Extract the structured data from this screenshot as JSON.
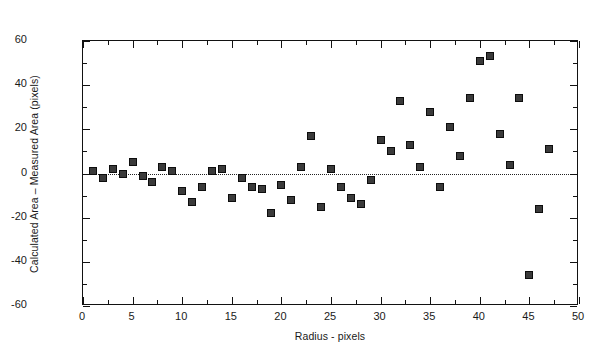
{
  "chart_data": {
    "type": "scatter",
    "title": "",
    "xlabel": "Radius - pixels",
    "ylabel": "Calculated Area – Measured Area (pixels)",
    "xlim": [
      0,
      50
    ],
    "ylim": [
      -60,
      60
    ],
    "xticks": [
      0,
      5,
      10,
      15,
      20,
      25,
      30,
      35,
      40,
      45,
      50
    ],
    "yticks": [
      -60,
      -40,
      -20,
      0,
      20,
      40,
      60
    ],
    "xtick_labels": [
      "0",
      "5",
      "10",
      "15",
      "20",
      "25",
      "30",
      "35",
      "40",
      "45",
      "50"
    ],
    "ytick_labels": [
      "-60",
      "-40",
      "-20",
      "0",
      "20",
      "40",
      "60"
    ],
    "x_minor_interval": 2.5,
    "y_minor_interval": 10,
    "grid": false,
    "legend": false,
    "reference_line": {
      "type": "horizontal",
      "y": 0,
      "style": "dotted"
    },
    "marker": {
      "shape": "square",
      "fill": "#3a3a3a",
      "edge": "#0d0d0d",
      "size": 8
    },
    "series": [
      {
        "name": "Calculated minus measured area",
        "points": [
          {
            "x": 1,
            "y": 1
          },
          {
            "x": 2,
            "y": -2
          },
          {
            "x": 3,
            "y": 2
          },
          {
            "x": 4,
            "y": 0
          },
          {
            "x": 5,
            "y": 5
          },
          {
            "x": 6,
            "y": -1
          },
          {
            "x": 7,
            "y": -4
          },
          {
            "x": 8,
            "y": 3
          },
          {
            "x": 9,
            "y": 1
          },
          {
            "x": 10,
            "y": -8
          },
          {
            "x": 11,
            "y": -13
          },
          {
            "x": 12,
            "y": -6
          },
          {
            "x": 13,
            "y": 1
          },
          {
            "x": 14,
            "y": 2
          },
          {
            "x": 15,
            "y": -11
          },
          {
            "x": 16,
            "y": -2
          },
          {
            "x": 17,
            "y": -6
          },
          {
            "x": 18,
            "y": -7
          },
          {
            "x": 19,
            "y": -18
          },
          {
            "x": 20,
            "y": -5
          },
          {
            "x": 21,
            "y": -12
          },
          {
            "x": 22,
            "y": 3
          },
          {
            "x": 23,
            "y": 17
          },
          {
            "x": 24,
            "y": -15
          },
          {
            "x": 25,
            "y": 2
          },
          {
            "x": 26,
            "y": -6
          },
          {
            "x": 27,
            "y": -11
          },
          {
            "x": 28,
            "y": -14
          },
          {
            "x": 29,
            "y": -3
          },
          {
            "x": 30,
            "y": 15
          },
          {
            "x": 31,
            "y": 10
          },
          {
            "x": 32,
            "y": 33
          },
          {
            "x": 33,
            "y": 13
          },
          {
            "x": 34,
            "y": 3
          },
          {
            "x": 35,
            "y": 28
          },
          {
            "x": 36,
            "y": -6
          },
          {
            "x": 37,
            "y": 21
          },
          {
            "x": 38,
            "y": 8
          },
          {
            "x": 39,
            "y": 34
          },
          {
            "x": 40,
            "y": 51
          },
          {
            "x": 41,
            "y": 53
          },
          {
            "x": 42,
            "y": 18
          },
          {
            "x": 43,
            "y": 4
          },
          {
            "x": 44,
            "y": 34
          },
          {
            "x": 45,
            "y": -46
          },
          {
            "x": 46,
            "y": -16
          },
          {
            "x": 47,
            "y": 11
          }
        ]
      }
    ]
  }
}
